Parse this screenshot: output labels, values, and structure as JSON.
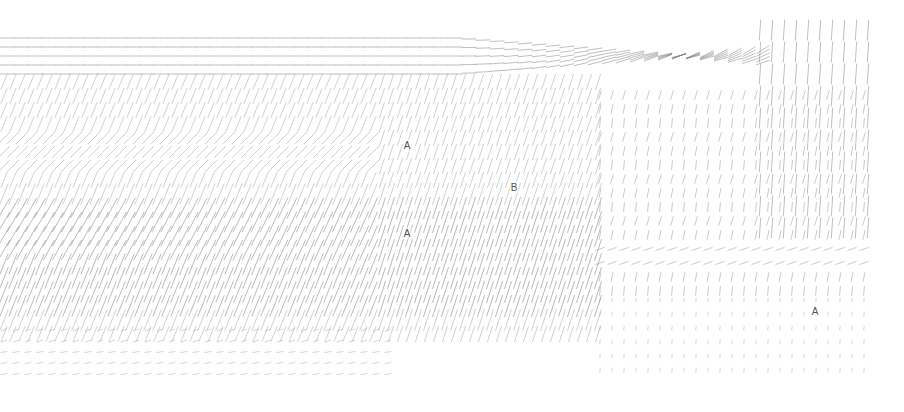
{
  "diagram": {
    "type": "orientation-field",
    "width": 904,
    "height": 412,
    "stroke_color": "#6e6e6e",
    "background": "#ffffff",
    "labels": [
      {
        "text": "A",
        "x": 407,
        "y": 145
      },
      {
        "text": "B",
        "x": 514,
        "y": 187
      },
      {
        "text": "A",
        "x": 407,
        "y": 233
      },
      {
        "text": "A",
        "x": 815,
        "y": 311
      }
    ]
  }
}
